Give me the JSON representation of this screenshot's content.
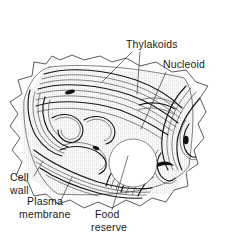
{
  "figure": {
    "style": "stippled line drawing",
    "background_color": "#ffffff",
    "ink_color": "#1a1a1a",
    "width": 237,
    "height": 246
  },
  "labels": [
    {
      "id": "thylakoids",
      "text": "Thylakoids",
      "x": 126,
      "y": 48,
      "anchor": "start",
      "leaders": [
        {
          "x1": 132,
          "y1": 52,
          "x2": 102,
          "y2": 82
        },
        {
          "x1": 140,
          "y1": 52,
          "x2": 137,
          "y2": 94
        }
      ]
    },
    {
      "id": "nucleoid",
      "text": "Nucleoid",
      "x": 163,
      "y": 68,
      "anchor": "start",
      "leaders": [
        {
          "x1": 166,
          "y1": 72,
          "x2": 141,
          "y2": 129
        }
      ]
    },
    {
      "id": "cell-wall",
      "text": "Cell",
      "text2": "wall",
      "x": 10,
      "y": 181,
      "anchor": "start",
      "leaders": [
        {
          "x1": 34,
          "y1": 176,
          "x2": 43,
          "y2": 161
        }
      ]
    },
    {
      "id": "plasma-membrane",
      "text": "Plasma",
      "text2": "membrane",
      "x": 27,
      "y": 205,
      "anchor": "start",
      "leaders": [
        {
          "x1": 61,
          "y1": 200,
          "x2": 72,
          "y2": 177
        }
      ]
    },
    {
      "id": "food-reserve",
      "text": "Food",
      "text2": "reserve",
      "x": 95,
      "y": 218,
      "anchor": "start",
      "leaders": [
        {
          "x1": 112,
          "y1": 210,
          "x2": 128,
          "y2": 156
        }
      ]
    }
  ],
  "structures": {
    "cell_wall": "spiked irregular quadrilateral outline",
    "food_reserve": "white circular granule, center (133,163), radius 24",
    "thylakoid_count_hint": "many concentric wavy membrane lamellae"
  }
}
